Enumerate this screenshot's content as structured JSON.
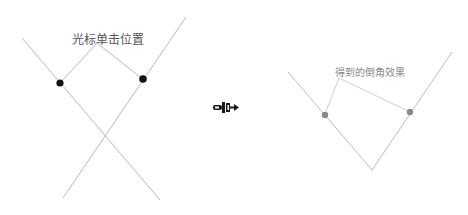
{
  "diagram": {
    "left_panel": {
      "label": "光标单击位置",
      "point_color": "#111111",
      "line_color": "#b8b8b8"
    },
    "arrow": {
      "icon": "right-arrow-icon",
      "glyph": "➼"
    },
    "right_panel": {
      "label": "得到的倒角效果",
      "point_color": "#888888",
      "line_color": "#bdbdbd"
    }
  }
}
